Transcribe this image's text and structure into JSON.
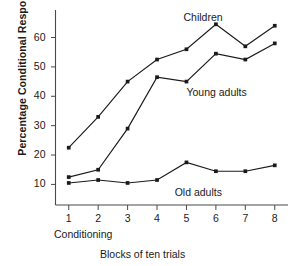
{
  "chart_data": {
    "type": "line",
    "title": "",
    "xlabel": "Blocks of ten trials",
    "ylabel": "Percentage Conditional Responses",
    "secondary_xlabel": "Conditioning",
    "categories": [
      "1",
      "2",
      "3",
      "4",
      "5",
      "6",
      "7",
      "8"
    ],
    "x": [
      1,
      2,
      3,
      4,
      5,
      6,
      7,
      8
    ],
    "xlim": [
      0.55,
      8.45
    ],
    "ylim": [
      3,
      68
    ],
    "yticks": [
      10,
      20,
      30,
      40,
      50,
      60
    ],
    "ytick_labels": [
      "10",
      "20",
      "30",
      "40",
      "50",
      "60"
    ],
    "grid": false,
    "legend_position": "inline-annotations",
    "marker": "filled-square",
    "line_color": "#1a1a1a",
    "series": [
      {
        "name": "Children",
        "values": [
          22.5,
          33,
          45,
          52.5,
          56,
          64.5,
          57,
          64
        ]
      },
      {
        "name": "Young adults",
        "values": [
          12.5,
          15,
          29,
          46.5,
          45,
          54.5,
          52.5,
          58
        ]
      },
      {
        "name": "Old adults",
        "values": [
          10.5,
          11.5,
          10.5,
          11.5,
          17.5,
          14.5,
          14.5,
          16.5
        ]
      }
    ],
    "annotations": [
      {
        "text": "Children",
        "series": "Children",
        "x": 4.9,
        "y": 66.5
      },
      {
        "text": "Young adults",
        "series": "Young adults",
        "x": 5.0,
        "y": 41.0
      },
      {
        "text": "Old adults",
        "series": "Old adults",
        "x": 4.6,
        "y": 7.0
      }
    ]
  }
}
